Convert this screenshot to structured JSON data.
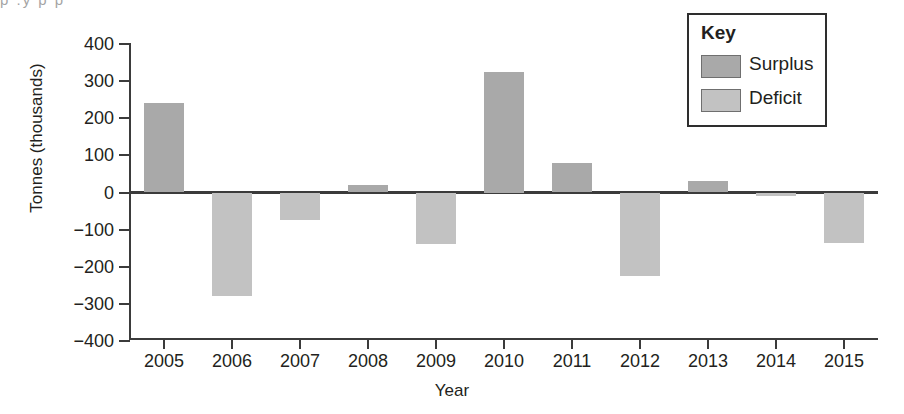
{
  "artifact": {
    "top_text_fragment": "p   .y p                    p"
  },
  "legend": {
    "title": "Key",
    "entries": [
      {
        "label": "Surplus",
        "color": "#a9a9a9"
      },
      {
        "label": "Deficit",
        "color": "#c2c2c2"
      }
    ]
  },
  "colors": {
    "surplus": "#a9a9a9",
    "deficit": "#c2c2c2",
    "axis": "#3b3b3b",
    "text": "#231f20"
  },
  "chart_data": {
    "type": "bar",
    "title": "",
    "xlabel": "Year",
    "ylabel": "Tonnes (thousands)",
    "categories": [
      "2005",
      "2006",
      "2007",
      "2008",
      "2009",
      "2010",
      "2011",
      "2012",
      "2013",
      "2014",
      "2015"
    ],
    "values": [
      240,
      -280,
      -75,
      20,
      -140,
      325,
      80,
      -225,
      30,
      -10,
      -135
    ],
    "ylim": [
      -400,
      400
    ],
    "yticks": [
      400,
      300,
      200,
      100,
      0,
      -100,
      -200,
      -300,
      -400
    ],
    "ytick_labels": [
      "400",
      "300",
      "200",
      "100",
      "0",
      "−100",
      "−200",
      "−300",
      "−400"
    ],
    "grid": false,
    "legend_position": "top-right",
    "series": [
      {
        "name": "Surplus",
        "color": "#a9a9a9",
        "points": [
          {
            "x": "2005",
            "y": 240
          },
          {
            "x": "2008",
            "y": 20
          },
          {
            "x": "2010",
            "y": 325
          },
          {
            "x": "2011",
            "y": 80
          },
          {
            "x": "2013",
            "y": 30
          }
        ]
      },
      {
        "name": "Deficit",
        "color": "#c2c2c2",
        "points": [
          {
            "x": "2006",
            "y": -280
          },
          {
            "x": "2007",
            "y": -75
          },
          {
            "x": "2009",
            "y": -140
          },
          {
            "x": "2012",
            "y": -225
          },
          {
            "x": "2014",
            "y": -10
          },
          {
            "x": "2015",
            "y": -135
          }
        ]
      }
    ]
  }
}
